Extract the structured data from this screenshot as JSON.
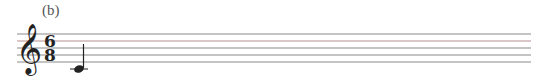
{
  "figure": {
    "label": "(b)",
    "clef": "treble",
    "time_signature": {
      "numerator": "6",
      "denominator": "8"
    },
    "notes": [
      {
        "pitch": "C4",
        "duration": "quarter",
        "ledger_line": true,
        "stem": "up"
      }
    ],
    "staff_line_color": "#8a8a8a"
  }
}
